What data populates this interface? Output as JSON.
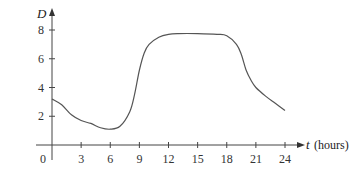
{
  "chart_data": {
    "type": "line",
    "title": "",
    "xlabel": "t (hours)",
    "ylabel": "D",
    "xlabel_var": "t",
    "xlabel_unit": "(hours)",
    "xlim": [
      0,
      24
    ],
    "ylim": [
      0,
      8
    ],
    "grid": false,
    "legend": null,
    "x_ticks": [
      0,
      3,
      6,
      9,
      12,
      15,
      18,
      21,
      24
    ],
    "y_ticks": [
      2,
      4,
      6,
      8
    ],
    "origin_label": "0",
    "series": [
      {
        "name": "D",
        "x": [
          0,
          1,
          2,
          3,
          4,
          5,
          6,
          7,
          8,
          8.5,
          9,
          9.5,
          10,
          11,
          12,
          13,
          15,
          17,
          18,
          19,
          19.5,
          20,
          20.5,
          21,
          22,
          23,
          24
        ],
        "values": [
          3.2,
          2.8,
          2.1,
          1.7,
          1.5,
          1.2,
          1.1,
          1.3,
          2.3,
          3.5,
          5.2,
          6.4,
          7.0,
          7.5,
          7.7,
          7.75,
          7.75,
          7.7,
          7.6,
          7.0,
          6.3,
          5.2,
          4.5,
          4.0,
          3.4,
          2.9,
          2.4
        ]
      }
    ]
  }
}
